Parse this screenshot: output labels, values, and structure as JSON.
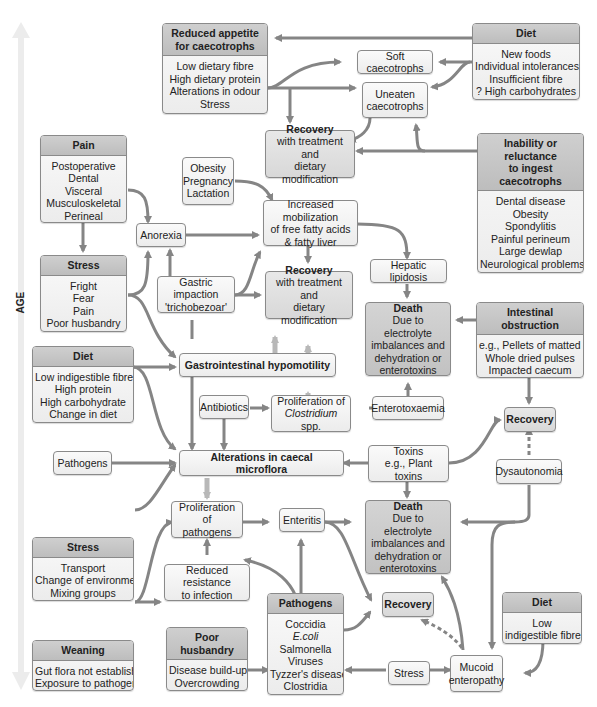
{
  "axis": {
    "label": "AGE"
  },
  "nodes": {
    "reduced_appetite": {
      "title": "Reduced appetite for caecotrophs",
      "title_l1": "Reduced appetite",
      "title_l2": "for caecotrophs",
      "items": [
        "Low dietary fibre",
        "High dietary protein",
        "Alterations in odour",
        "Stress"
      ]
    },
    "diet_top": {
      "title": "Diet",
      "items": [
        "New foods",
        "Individual intolerances",
        "Insufficient fibre",
        "? High carbohydrates"
      ]
    },
    "soft_caecotrophs": {
      "label": "Soft caecotrophs"
    },
    "uneaten_caecotrophs": {
      "l1": "Uneaten",
      "l2": "caecotrophs"
    },
    "recovery_top": {
      "title": "Recovery",
      "l1": "with treatment and",
      "l2": "dietary modification"
    },
    "inability": {
      "title_l1": "Inability or reluctance",
      "title_l2": "to ingest caecotrophs",
      "items": [
        "Dental disease",
        "Obesity",
        "Spondylitis",
        "Painful perineum",
        "Large dewlap",
        "Neurological problems",
        "Perineal skin folds",
        "Elizabethan collars"
      ]
    },
    "pain": {
      "title": "Pain",
      "items": [
        "Postoperative",
        "Dental",
        "Visceral",
        "Musculoskeletal",
        "Perineal"
      ]
    },
    "obesity": {
      "items": [
        "Obesity",
        "Pregnancy",
        "Lactation"
      ]
    },
    "increased_mobilization": {
      "l1": "Increased mobilization",
      "l2": "of free fatty acids",
      "l3": "& fatty liver"
    },
    "anorexia": {
      "label": "Anorexia"
    },
    "stress_mid": {
      "title": "Stress",
      "items": [
        "Fright",
        "Fear",
        "Pain",
        "Poor husbandry"
      ]
    },
    "gastric_impaction": {
      "l1": "Gastric impaction",
      "l2": "'trichobezoar'"
    },
    "recovery_mid": {
      "title": "Recovery",
      "l1": "with treatment and",
      "l2": "dietary modification"
    },
    "hepatic_lipidosis": {
      "label": "Hepatic lipidosis"
    },
    "death_top": {
      "title": "Death",
      "items": [
        "Due to electrolyte",
        "imbalances and",
        "dehydration or",
        "enterotoxins"
      ]
    },
    "intestinal_obstruction": {
      "title": "Intestinal obstruction",
      "items": [
        "e.g., Pellets of matted hair",
        "Whole dried pulses",
        "Impacted caecum",
        "Proliferation of pathogens"
      ]
    },
    "diet_mid": {
      "title": "Diet",
      "items": [
        "Low indigestible fibre",
        "High protein",
        "High carbohydrate",
        "Change in diet"
      ]
    },
    "gi_hypomotility": {
      "label": "Gastrointestinal hypomotility"
    },
    "antibiotics": {
      "label": "Antibiotics"
    },
    "proliferation_clostridium": {
      "l1": "Proliferation of",
      "l2_italic": "Clostridium",
      "l2_rest": " spp."
    },
    "enterotoxaemia": {
      "label": "Enterotoxaemia"
    },
    "recovery_right": {
      "label": "Recovery"
    },
    "pathogens_small": {
      "label": "Pathogens"
    },
    "alterations_microflora": {
      "label": "Alterations in caecal microflora"
    },
    "toxins": {
      "l1": "Toxins",
      "l2": "e.g., Plant toxins"
    },
    "dysautonomia": {
      "label": "Dysautonomia"
    },
    "proliferation_pathogens": {
      "l1": "Proliferation of",
      "l2": "pathogens"
    },
    "enteritis": {
      "label": "Enteritis"
    },
    "death_bottom": {
      "title": "Death",
      "items": [
        "Due to electrolyte",
        "imbalances and",
        "dehydration or",
        "enterotoxins"
      ]
    },
    "stress_low": {
      "title": "Stress",
      "items": [
        "Transport",
        "Change of environment",
        "Mixing groups"
      ]
    },
    "reduced_resistance": {
      "l1": "Reduced resistance",
      "l2": "to infection"
    },
    "pathogens_box": {
      "title": "Pathogens",
      "items": [
        "Coccidia",
        "E.coli",
        "Salmonella",
        "Viruses",
        "Tyzzer's disease",
        "Clostridia"
      ]
    },
    "recovery_bottom": {
      "label": "Recovery"
    },
    "diet_bottom": {
      "title": "Diet",
      "items": [
        "Low",
        "indigestible fibre"
      ]
    },
    "weaning": {
      "title": "Weaning",
      "items": [
        "Gut flora not established",
        "Exposure to pathogens"
      ]
    },
    "poor_husbandry": {
      "title": "Poor husbandry",
      "items": [
        "Disease build-up",
        "Overcrowding",
        "Stress"
      ]
    },
    "stress_small": {
      "label": "Stress"
    },
    "mucoid_enteropathy": {
      "l1": "Mucoid",
      "l2": "enteropathy"
    }
  },
  "colors": {
    "arrow": "#858585",
    "header": "#c6c6c6",
    "death": "#c9c9c9",
    "age_arrow": "#ececec"
  }
}
